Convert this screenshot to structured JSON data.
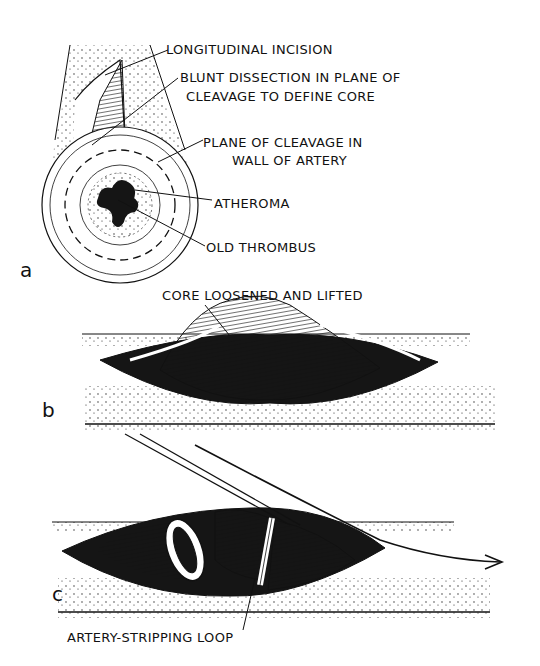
{
  "figure": {
    "panels": [
      {
        "letter": "a",
        "labels": {
          "longitudinal_incision": "LONGITUDINAL INCISION",
          "blunt_dissection_1": "BLUNT  DISSECTION IN PLANE OF",
          "blunt_dissection_2": "CLEAVAGE TO DEFINE CORE",
          "plane_cleavage_1": "PLANE OF CLEAVAGE IN",
          "plane_cleavage_2": "WALL OF ARTERY",
          "atheroma": "ATHEROMA",
          "old_thrombus": "OLD THROMBUS"
        }
      },
      {
        "letter": "b",
        "labels": {
          "core_loosened": "CORE LOOSENED AND LIFTED"
        }
      },
      {
        "letter": "c",
        "labels": {
          "stripping_loop": "ARTERY-STRIPPING LOOP"
        }
      }
    ]
  },
  "colors": {
    "ink": "#111111",
    "paper": "#ffffff"
  }
}
